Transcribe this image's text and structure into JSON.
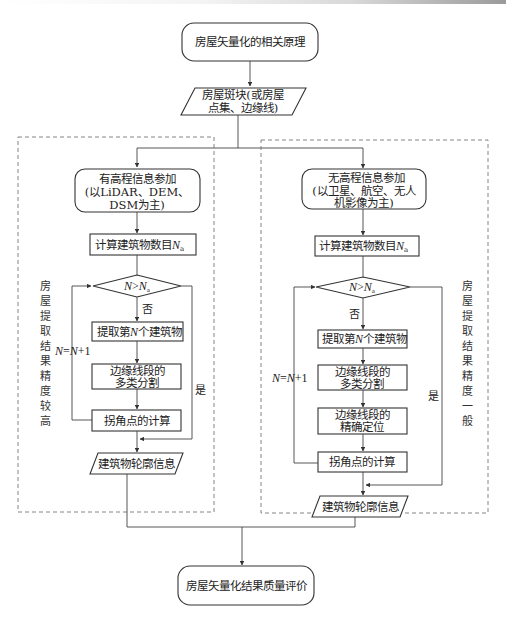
{
  "diagram": {
    "start": {
      "label": "房屋矢量化的相关原理"
    },
    "input": {
      "line1": "房屋斑块(或房屋",
      "line2": "点集、边缘线)"
    },
    "left_branch": {
      "start": {
        "line1": "有高程信息参加",
        "line2": "(以LiDAR、DEM、",
        "line3": "DSM为主)"
      },
      "count": {
        "text": "计算建筑物数目",
        "var": "N",
        "sub": "a"
      },
      "decision": {
        "left": "N",
        "op": ">",
        "right": "N",
        "sub": "a"
      },
      "no_label": "否",
      "yes_label": "是",
      "loop_label": {
        "lhs": "N",
        "eq": "=",
        "rhs": "N",
        "plus": "+1"
      },
      "extract": {
        "pre": "提取第",
        "var": "N",
        "post": "个建筑物"
      },
      "segment": {
        "line1": "边缘线段的",
        "line2": "多类分割"
      },
      "corner": {
        "label": "拐角点的计算"
      },
      "output": {
        "label": "建筑物轮廓信息"
      },
      "side_label": [
        "房",
        "屋",
        "提",
        "取",
        "结",
        "果",
        "精",
        "度",
        "较",
        "高"
      ]
    },
    "right_branch": {
      "start": {
        "line1": "无高程信息参加",
        "line2": "(以卫星、航空、无人",
        "line3": "机影像为主)"
      },
      "count": {
        "text": "计算建筑物数目",
        "var": "N",
        "sub": "a"
      },
      "decision": {
        "left": "N",
        "op": ">",
        "right": "N",
        "sub": "a"
      },
      "no_label": "否",
      "yes_label": "是",
      "loop_label": {
        "lhs": "N",
        "eq": "=",
        "rhs": "N",
        "plus": "+1"
      },
      "extract": {
        "pre": "提取第",
        "var": "N",
        "post": "个建筑物"
      },
      "segment": {
        "line1": "边缘线段的",
        "line2": "多类分割"
      },
      "locate": {
        "line1": "边缘线段的",
        "line2": "精确定位"
      },
      "corner": {
        "label": "拐角点的计算"
      },
      "output": {
        "label": "建筑物轮廓信息"
      },
      "side_label": [
        "房",
        "屋",
        "提",
        "取",
        "结",
        "果",
        "精",
        "度",
        "一",
        "般"
      ]
    },
    "end": {
      "label": "房屋矢量化结果质量评价"
    }
  },
  "colors": {
    "stroke": "#333333",
    "dashed": "#777777",
    "background": "#ffffff"
  }
}
